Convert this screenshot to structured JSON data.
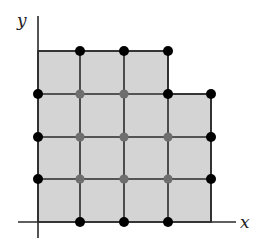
{
  "diagram": {
    "axes": {
      "x_label": "x",
      "y_label": "y"
    },
    "colors": {
      "region_fill": "#d4d4d4",
      "grid_line": "#2a2a2a",
      "boundary_point": "#000000",
      "interior_point": "#6e6e6e"
    },
    "grid": {
      "columns_x": [
        38,
        80,
        124,
        168,
        211
      ],
      "rows_y": [
        51,
        94,
        137,
        179,
        222
      ]
    },
    "region": {
      "description": "Shaded lattice region: 3 unit squares wide in top row, 4 unit squares wide in lower three rows",
      "polygon": [
        [
          38,
          51
        ],
        [
          168,
          51
        ],
        [
          168,
          94
        ],
        [
          211,
          94
        ],
        [
          211,
          222
        ],
        [
          38,
          222
        ]
      ]
    },
    "boundary_points": [
      [
        80,
        51
      ],
      [
        124,
        51
      ],
      [
        168,
        51
      ],
      [
        38,
        94
      ],
      [
        168,
        94
      ],
      [
        211,
        94
      ],
      [
        38,
        137
      ],
      [
        211,
        137
      ],
      [
        38,
        179
      ],
      [
        211,
        179
      ],
      [
        80,
        222
      ],
      [
        124,
        222
      ],
      [
        168,
        222
      ]
    ],
    "interior_points": [
      [
        80,
        94
      ],
      [
        124,
        94
      ],
      [
        80,
        137
      ],
      [
        124,
        137
      ],
      [
        168,
        137
      ],
      [
        80,
        179
      ],
      [
        124,
        179
      ],
      [
        168,
        179
      ]
    ]
  }
}
